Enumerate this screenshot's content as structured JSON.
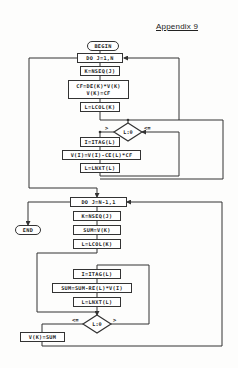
{
  "page": {
    "heading": "Appendix 9"
  },
  "flowchart": {
    "begin": "BEGIN",
    "end": "END",
    "loop1": {
      "do": "DO J=1,N",
      "k_assign": "K=NSEQ(J)",
      "cf_line1": "CF=DE(K)*V(K)",
      "cf_line2": "V(K)=CF",
      "lcol": "L=LCOL(K)",
      "decision": "L:0",
      "decision_gt": ">",
      "decision_le": "<=",
      "itag": "I=ITAG(L)",
      "update": "V(I)=V(I)-CE(L)*CF",
      "lnxt": "L=LNXT(L)"
    },
    "loop2": {
      "do": "DO J=N-1,1",
      "k_assign": "K=NSEQ(J)",
      "sum_init": "SUM=V(K)",
      "lcol": "L=LCOL(K)",
      "itag": "I=ITAG(L)",
      "update": "SUM=SUM-RE(L)*V(I)",
      "lnxt": "L=LNXT(L)",
      "decision": "L:0",
      "decision_le": "<=",
      "decision_gt": ">",
      "store": "V(K)=SUM"
    }
  },
  "colors": {
    "line": "#333333",
    "paper": "#fdfdfc"
  }
}
